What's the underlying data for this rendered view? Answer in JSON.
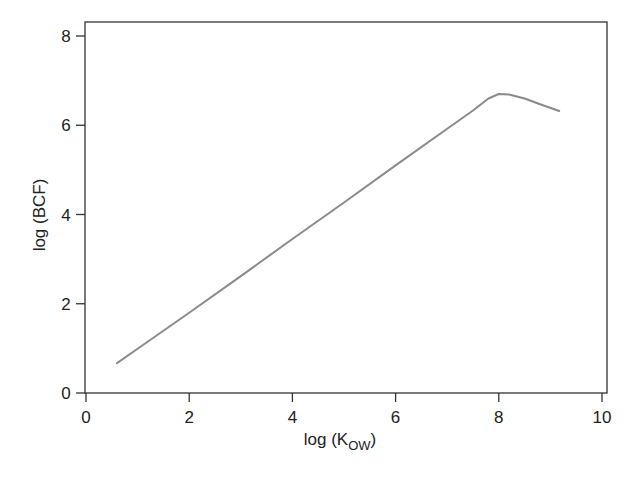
{
  "chart_data": {
    "type": "line",
    "title": "",
    "xlabel": "log (K_OW)",
    "xlabel_main": "log (K",
    "xlabel_sub": "OW",
    "xlabel_close": ")",
    "ylabel": "log (BCF)",
    "xlim": [
      0,
      10
    ],
    "ylim": [
      0,
      8
    ],
    "xticks": [
      0,
      2,
      4,
      6,
      8,
      10
    ],
    "yticks": [
      0,
      2,
      4,
      6,
      8
    ],
    "grid": false,
    "legend": null,
    "series": [
      {
        "name": "log BCF vs log Kow",
        "color": "#8a8a8a",
        "x": [
          0.6,
          1.0,
          2.0,
          3.0,
          4.0,
          5.0,
          6.0,
          7.0,
          7.5,
          7.8,
          8.0,
          8.2,
          8.5,
          8.8,
          9.17
        ],
        "y": [
          0.67,
          0.99,
          1.8,
          2.62,
          3.45,
          4.27,
          5.1,
          5.92,
          6.33,
          6.6,
          6.7,
          6.69,
          6.6,
          6.47,
          6.32
        ]
      }
    ]
  }
}
